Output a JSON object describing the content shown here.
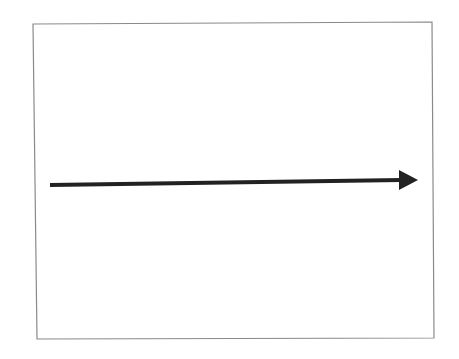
{
  "diagram": {
    "type": "single-arrow",
    "frame": {
      "stroke": "#8a8a8a",
      "top_left": [
        33,
        24
      ],
      "top_right": [
        432,
        22
      ],
      "bottom_right": [
        434,
        338
      ],
      "bottom_left": [
        37,
        339
      ]
    },
    "arrow": {
      "direction": "right",
      "color": "#222222",
      "start": [
        50,
        185
      ],
      "end": [
        400,
        180
      ],
      "head_tip": [
        418,
        180
      ],
      "stroke_width": 4
    }
  }
}
